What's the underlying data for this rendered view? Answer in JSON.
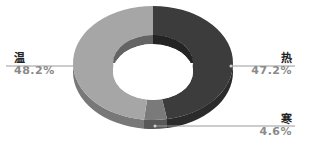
{
  "chart_data": {
    "type": "pie",
    "subtype": "donut-3d",
    "title": "",
    "categories": [
      "热",
      "寒",
      "温"
    ],
    "values": [
      47.2,
      4.6,
      48.2
    ],
    "value_labels": [
      "47.2%",
      "4.6%",
      "48.2%"
    ],
    "colors": [
      "#3c3c3c",
      "#7a7a7a",
      "#a6a6a6"
    ],
    "start_angle_deg": 90,
    "direction": "clockwise",
    "legend": "none",
    "labels_position": "outside-with-leader-lines"
  },
  "labels": {
    "hot": {
      "name": "热",
      "pct": "47.2%"
    },
    "cold": {
      "name": "寒",
      "pct": "4.6%"
    },
    "warm": {
      "name": "温",
      "pct": "48.2%"
    }
  }
}
